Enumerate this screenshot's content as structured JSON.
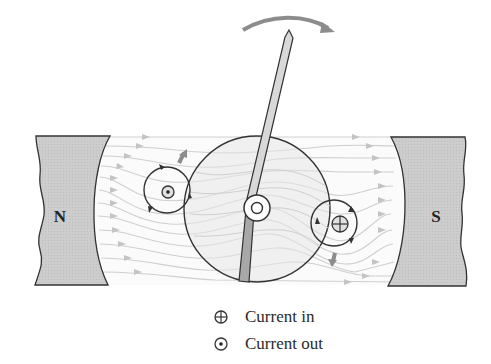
{
  "figure": {
    "magnets": [
      {
        "id": "north",
        "label": "N"
      },
      {
        "id": "south",
        "label": "S"
      }
    ],
    "rotation_arrow": {
      "direction": "clockwise"
    },
    "coil_conductors": [
      {
        "id": "left",
        "current": "out",
        "force_direction": "up"
      },
      {
        "id": "right",
        "current": "in",
        "force_direction": "down"
      }
    ],
    "colors": {
      "magnet_fill": "#cfcfcf",
      "outline": "#333333",
      "field_lines": "#c8c8c8",
      "arrow_gray": "#8c8c8c",
      "core_fill": "#ececec"
    }
  },
  "legend": {
    "items": [
      {
        "symbol": "circle-plus",
        "label": "Current in"
      },
      {
        "symbol": "circle-dot",
        "label": "Current out"
      }
    ]
  }
}
